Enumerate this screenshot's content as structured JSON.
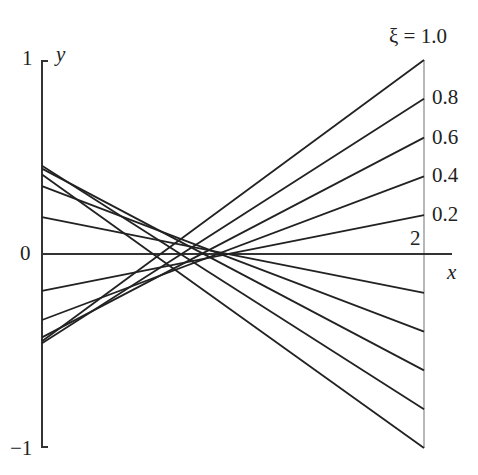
{
  "chart_data": {
    "type": "line",
    "title": "",
    "xlabel": "x",
    "ylabel": "y",
    "xlim": [
      0,
      2
    ],
    "ylim": [
      -1,
      1
    ],
    "grid": false,
    "legend_position": "right-edge labels",
    "x_ticks": [
      "2"
    ],
    "y_ticks": [
      "1",
      "0",
      "−1"
    ],
    "parameter_label": "ξ",
    "series_labels": [
      "ξ = 1.0",
      "0.8",
      "0.6",
      "0.4",
      "0.2"
    ],
    "series": [
      {
        "name": "ξ=0.2 rising",
        "x": [
          0,
          2
        ],
        "y": [
          -0.19,
          0.2
        ]
      },
      {
        "name": "ξ=0.4 rising",
        "x": [
          0,
          2
        ],
        "y": [
          -0.34,
          0.4
        ]
      },
      {
        "name": "ξ=0.6 rising",
        "x": [
          0,
          2
        ],
        "y": [
          -0.43,
          0.6
        ]
      },
      {
        "name": "ξ=0.8 rising",
        "x": [
          0,
          2
        ],
        "y": [
          -0.46,
          0.8
        ]
      },
      {
        "name": "ξ=1.0 rising",
        "x": [
          0,
          2
        ],
        "y": [
          -0.45,
          1.0
        ]
      },
      {
        "name": "ξ=0.2 falling",
        "x": [
          0,
          2
        ],
        "y": [
          0.19,
          -0.2
        ]
      },
      {
        "name": "ξ=0.4 falling",
        "x": [
          0,
          2
        ],
        "y": [
          0.35,
          -0.4
        ]
      },
      {
        "name": "ξ=0.6 falling",
        "x": [
          0,
          2
        ],
        "y": [
          0.44,
          -0.6
        ]
      },
      {
        "name": "ξ=0.8 falling",
        "x": [
          0,
          2
        ],
        "y": [
          0.455,
          -0.8
        ]
      },
      {
        "name": "ξ=1.0 falling",
        "x": [
          0,
          2
        ],
        "y": [
          0.41,
          -1.0
        ]
      },
      {
        "name": "ξ=0",
        "x": [
          0,
          2
        ],
        "y": [
          0,
          0
        ]
      }
    ]
  },
  "labels": {
    "y_axis": "y",
    "x_axis": "x",
    "y_top": "1",
    "y_zero": "0",
    "y_bottom": "−1",
    "x_tick": "2",
    "xi_1": "ξ = 1.0",
    "xi_08": "0.8",
    "xi_06": "0.6",
    "xi_04": "0.4",
    "xi_02": "0.2"
  },
  "style": {
    "line_color": "#222222",
    "axis_color": "#333333",
    "right_axis_color": "#888888"
  }
}
